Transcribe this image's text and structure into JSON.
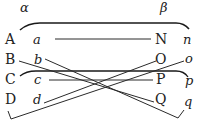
{
  "diagram": {
    "type": "line-pairing diagram",
    "header_labels": {
      "left": "α",
      "right": "β"
    },
    "rows": [
      {
        "left_upper": "A",
        "left_lower": "a",
        "right_upper": "N",
        "right_lower": "n"
      },
      {
        "left_upper": "B",
        "left_lower": "b",
        "right_upper": "O",
        "right_lower": "o"
      },
      {
        "left_upper": "C",
        "left_lower": "c",
        "right_upper": "P",
        "right_lower": "p"
      },
      {
        "left_upper": "D",
        "left_lower": "d",
        "right_upper": "Q",
        "right_lower": "q"
      }
    ],
    "connections": [
      {
        "from": "A",
        "to": "n",
        "style": "arc"
      },
      {
        "from": "a",
        "to": "N",
        "style": "straight"
      },
      {
        "from": "B",
        "to": "Q",
        "style": "straight"
      },
      {
        "from": "b",
        "to": "q",
        "style": "straight"
      },
      {
        "from": "C",
        "to": "p",
        "style": "arc"
      },
      {
        "from": "c",
        "to": "P",
        "style": "straight"
      },
      {
        "from": "d",
        "to": "O",
        "style": "straight"
      },
      {
        "from": "D",
        "to": "o",
        "style": "bracket"
      }
    ],
    "colors": {
      "ink": "#222222",
      "background": "#ffffff"
    }
  }
}
